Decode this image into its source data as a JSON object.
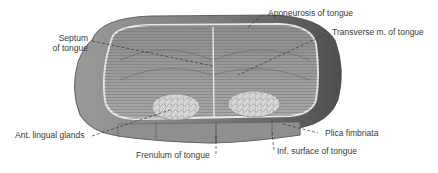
{
  "figure": {
    "colors": {
      "background": "#ffffff",
      "outer_mucosa": "#8a8a8a",
      "outer_dark": "#4a4a4a",
      "cut_surface": "#9c9c9c",
      "aponeurosis_line": "#e6e6e6",
      "glands": "#d4d4d4",
      "leader_line": "#333333",
      "label_text": "#3a3a3a"
    }
  },
  "labels": {
    "septum_line1": "Septum",
    "septum_line2": "of tongue",
    "aponeurosis": "Aponeurosis of tongue",
    "transverse": "Transverse m. of tongue",
    "ant_lingual_glands": "Ant. lingual glands",
    "plica_fimbriata": "Plica fimbriata",
    "frenulum": "Frenulum of tongue",
    "inf_surface": "Inf. surface of tongue"
  }
}
